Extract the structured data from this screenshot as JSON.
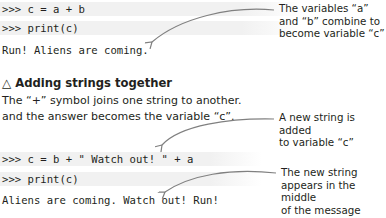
{
  "example1": {
    "lines": [
      ">>> c = a + b",
      ">>> print(c)",
      "Run! Aliens are coming."
    ],
    "annotation": [
      "The variables “a”",
      "and “b” combine to",
      "become variable “c”"
    ]
  },
  "section": {
    "icon": "triangle-icon",
    "icon_glyph": "△",
    "title": "Adding strings together",
    "body": [
      "The “+” symbol joins one string to another.",
      "and the answer becomes the variable “c”."
    ]
  },
  "example2": {
    "lines": [
      ">>> c = b + \" Watch out! \" + a",
      ">>> print(c)",
      "Aliens are coming. Watch out! Run!"
    ],
    "annotation_top": [
      "A new string is added",
      "to variable “c”"
    ],
    "annotation_bottom": [
      "The new string",
      "appears in the middle",
      "of the message"
    ]
  },
  "colors": {
    "text": "#231f20",
    "stripe": "#f1f1f1",
    "arrow": "#808080"
  }
}
